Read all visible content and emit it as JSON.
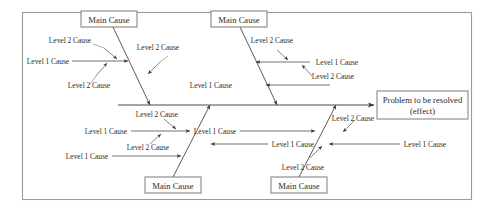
{
  "diagram": {
    "type": "fishbone-ishikawa",
    "title": "",
    "effect": {
      "line1": "Problem to be resolved",
      "line2": "(effect)"
    },
    "main_causes": [
      {
        "id": "top-left",
        "label": "Main Cause",
        "position": "top"
      },
      {
        "id": "top-right",
        "label": "Main Cause",
        "position": "top"
      },
      {
        "id": "bottom-left",
        "label": "Main Cause",
        "position": "bottom"
      },
      {
        "id": "bottom-right",
        "label": "Main Cause",
        "position": "bottom"
      }
    ],
    "branch_top_left": {
      "level1": [
        "Level 1 Cause"
      ],
      "level2": [
        "Level 2 Cause",
        "Level 2 Cause",
        "Level 2 Cause"
      ]
    },
    "branch_top_right": {
      "level1": [
        "Level 1 Cause",
        "Level 1 Cause"
      ],
      "level2": [
        "Level 2 Cause",
        "Level 2 Cause"
      ]
    },
    "branch_bottom_left": {
      "level1": [
        "Level 1 Cause",
        "Level 1 Cause"
      ],
      "level2": [
        "Level 2 Cause",
        "Level 2 Cause"
      ]
    },
    "branch_bottom_right": {
      "level1": [
        "Level 1 Cause",
        "Level 1 Cause"
      ],
      "level2": [
        "Level 2 Cause",
        "Level 2 Cause"
      ]
    },
    "labels": {
      "main_cause": "Main Cause",
      "level1": "Level 1 Cause",
      "level2": "Level 2 Cause"
    },
    "colors": {
      "background": "#ffffff",
      "frame": "#9a9a9a",
      "line": "#4a4a4a",
      "text": "#2b2b2b",
      "box_stroke": "#6e6e6e"
    }
  }
}
